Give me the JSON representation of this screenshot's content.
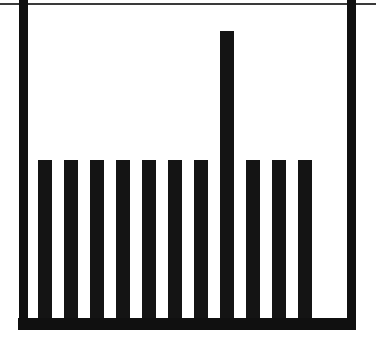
{
  "figure": {
    "title": "",
    "background_color": "#ffffff",
    "ink_color": "#101010",
    "frame_line_color": "#3a3a3a",
    "width_px": 376,
    "height_px": 351
  },
  "axes": {
    "baseline_y_px": 318,
    "baseline_thickness_px": 12,
    "baseline_left_px": 18,
    "baseline_right_px": 356,
    "top_frame_line_y_px": 3,
    "top_frame_line_thickness_px": 2,
    "left_edge_bar_x_px": 19,
    "left_edge_bar_width_px": 9,
    "right_edge_bar_x_px": 347,
    "right_edge_bar_width_px": 9,
    "xlabel": "",
    "ylabel": "",
    "tick_labels_x": [],
    "tick_labels_y": [],
    "grid": false,
    "legend": "none"
  },
  "chart_data": {
    "type": "bar",
    "title": "",
    "subtitle": "",
    "xlabel": "",
    "ylabel": "",
    "grid": false,
    "legend_position": "none",
    "xlim": [
      0,
      12
    ],
    "ylim": [
      0,
      100
    ],
    "categories": [
      "1",
      "2",
      "3",
      "4",
      "5",
      "6",
      "7",
      "8",
      "9",
      "10",
      "11"
    ],
    "values": [
      55,
      55,
      55,
      55,
      55,
      55,
      55,
      100,
      55,
      55,
      55
    ],
    "bar_color": "#141414",
    "bar_width_px": 14,
    "bar_pitch_px": 26,
    "first_bar_left_px": 38,
    "short_bar_top_px": 160,
    "tall_bar_index": 7,
    "tall_bar_top_px": 31,
    "annotations": []
  }
}
